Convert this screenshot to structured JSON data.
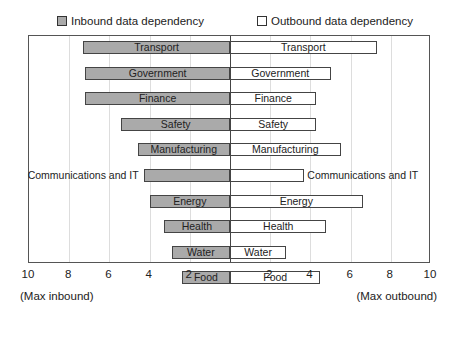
{
  "legend": {
    "inbound": "Inbound data dependency",
    "outbound": "Outbound data dependency"
  },
  "axis": {
    "left_ticks": [
      "10",
      "8",
      "6",
      "4",
      "2"
    ],
    "right_ticks": [
      "2",
      "4",
      "6",
      "8",
      "10"
    ],
    "left_note": "(Max inbound)",
    "right_note": "(Max outbound)"
  },
  "colors": {
    "inbound": "#aaaaaa",
    "outbound": "#ffffff",
    "border": "#444444"
  },
  "chart_data": {
    "type": "bar",
    "orientation": "horizontal-diverging",
    "title": "",
    "xlabel_left": "(Max inbound)",
    "xlabel_right": "(Max outbound)",
    "xlim": [
      -10,
      10
    ],
    "grid": true,
    "legend_position": "top",
    "categories": [
      "Transport",
      "Government",
      "Finance",
      "Safety",
      "Manufacturing",
      "Communications and IT",
      "Energy",
      "Health",
      "Water",
      "Food"
    ],
    "series": [
      {
        "name": "Inbound data dependency",
        "values": [
          7.3,
          7.2,
          7.2,
          5.4,
          4.6,
          4.3,
          4.0,
          3.3,
          2.9,
          2.4
        ]
      },
      {
        "name": "Outbound data dependency",
        "values": [
          7.3,
          5.0,
          4.3,
          4.3,
          5.5,
          3.7,
          6.6,
          4.8,
          2.8,
          4.5
        ]
      }
    ]
  }
}
